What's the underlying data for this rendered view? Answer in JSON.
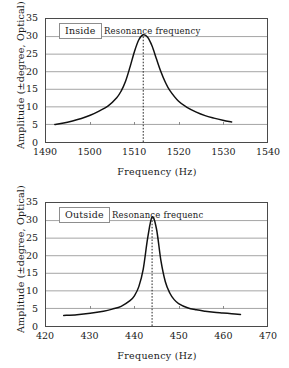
{
  "figure": {
    "background": "#ffffff",
    "line_color": "#111111",
    "grid_color": "#9a9a9a",
    "frame_color": "#4a4a4a"
  },
  "shared": {
    "xlabel": "Frequency (Hz)",
    "ylabel": "Amplitude (±degree, Optical)"
  },
  "chart_data": [
    {
      "type": "line",
      "id": "inside",
      "title": "",
      "series_label": "Inside",
      "annotation": "Resonance frequency",
      "xlabel": "Frequency (Hz)",
      "ylabel": "Amplitude (±degree, Optical)",
      "xlim": [
        1490,
        1540
      ],
      "ylim": [
        0,
        35
      ],
      "xticks": [
        1490,
        1500,
        1510,
        1520,
        1530,
        1540
      ],
      "yticks": [
        0,
        5,
        10,
        15,
        20,
        25,
        30,
        35
      ],
      "grid": "horizontal",
      "legend": "none",
      "resonance_frequency": 1512,
      "peak_amplitude": 30.5,
      "baseline_amplitude": 5.0,
      "fwhm": 7.0,
      "x_start": 1492,
      "x_end": 1532,
      "x": [
        1492,
        1494,
        1496,
        1498,
        1500,
        1502,
        1504,
        1506,
        1507,
        1508,
        1509,
        1510,
        1511,
        1512,
        1513,
        1514,
        1515,
        1516,
        1517,
        1518,
        1520,
        1522,
        1524,
        1526,
        1528,
        1530,
        1532
      ],
      "y": [
        5.0,
        5.4,
        6.0,
        6.7,
        7.6,
        8.8,
        10.2,
        12.6,
        14.5,
        17.3,
        21.3,
        25.7,
        29.1,
        30.5,
        29.8,
        27.3,
        23.6,
        20.0,
        17.0,
        14.7,
        11.6,
        9.8,
        8.5,
        7.5,
        6.8,
        6.2,
        5.7
      ]
    },
    {
      "type": "line",
      "id": "outside",
      "title": "",
      "series_label": "Outside",
      "annotation": "Resonance frequenc",
      "xlabel": "Frequency (Hz)",
      "ylabel": "Amplitude (±degree, Optical)",
      "xlim": [
        420,
        470
      ],
      "ylim": [
        0,
        35
      ],
      "xticks": [
        420,
        430,
        440,
        450,
        460,
        470
      ],
      "yticks": [
        0,
        5,
        10,
        15,
        20,
        25,
        30,
        35
      ],
      "grid": "horizontal",
      "legend": "none",
      "resonance_frequency": 444,
      "peak_amplitude": 31.0,
      "baseline_amplitude": 3.0,
      "fwhm": 3.6,
      "x_start": 424,
      "x_end": 464,
      "x": [
        424,
        427,
        430,
        433,
        435,
        437,
        439,
        440,
        441,
        442,
        443,
        444,
        445,
        446,
        447,
        448,
        449,
        450,
        452,
        454,
        456,
        458,
        460,
        462,
        464
      ],
      "y": [
        3.0,
        3.2,
        3.6,
        4.2,
        4.8,
        5.6,
        7.2,
        8.6,
        11.2,
        16.2,
        25.0,
        31.0,
        27.6,
        18.6,
        12.6,
        9.4,
        7.5,
        6.4,
        5.2,
        4.6,
        4.2,
        3.9,
        3.7,
        3.5,
        3.3
      ]
    }
  ]
}
